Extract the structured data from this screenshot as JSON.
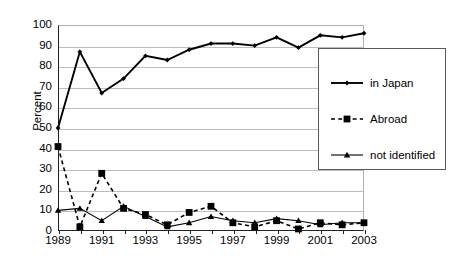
{
  "chart_data": {
    "type": "line",
    "title": "",
    "xlabel": "",
    "ylabel": "Percent",
    "ylim": [
      0,
      100
    ],
    "ytick_step": 10,
    "yticks": [
      100,
      90,
      80,
      70,
      60,
      50,
      40,
      30,
      20,
      10,
      0
    ],
    "x": [
      1989,
      1990,
      1991,
      1992,
      1993,
      1994,
      1995,
      1996,
      1997,
      1998,
      1999,
      2000,
      2001,
      2002,
      2003
    ],
    "xticklabels": [
      "1989",
      "1991",
      "1993",
      "1995",
      "1997",
      "1999",
      "2001",
      "2003"
    ],
    "xtick_years": [
      1989,
      1991,
      1993,
      1995,
      1997,
      1999,
      2001,
      2003
    ],
    "grid": "horizontal",
    "legend_position": "right",
    "series": [
      {
        "name": "in Japan",
        "marker": "diamond",
        "linestyle": "solid",
        "color": "#000000",
        "values": [
          50,
          87,
          67,
          74,
          85,
          83,
          88,
          91,
          91,
          90,
          94,
          89,
          95,
          94,
          96
        ]
      },
      {
        "name": "Abroad",
        "marker": "square",
        "linestyle": "dashed",
        "color": "#000000",
        "values": [
          41,
          2,
          28,
          11,
          8,
          3,
          9,
          12,
          4,
          2,
          5,
          1,
          4,
          3,
          4
        ]
      },
      {
        "name": "not identified",
        "marker": "triangle",
        "linestyle": "solid",
        "color": "#000000",
        "values": [
          10,
          11,
          5,
          12,
          7,
          2,
          4,
          7,
          5,
          4,
          6,
          5,
          3,
          4,
          4
        ]
      }
    ]
  },
  "axes": {
    "y_title": "Percent"
  },
  "legend": {
    "items": [
      {
        "label": "in Japan"
      },
      {
        "label": "Abroad"
      },
      {
        "label": "not identified"
      }
    ]
  }
}
